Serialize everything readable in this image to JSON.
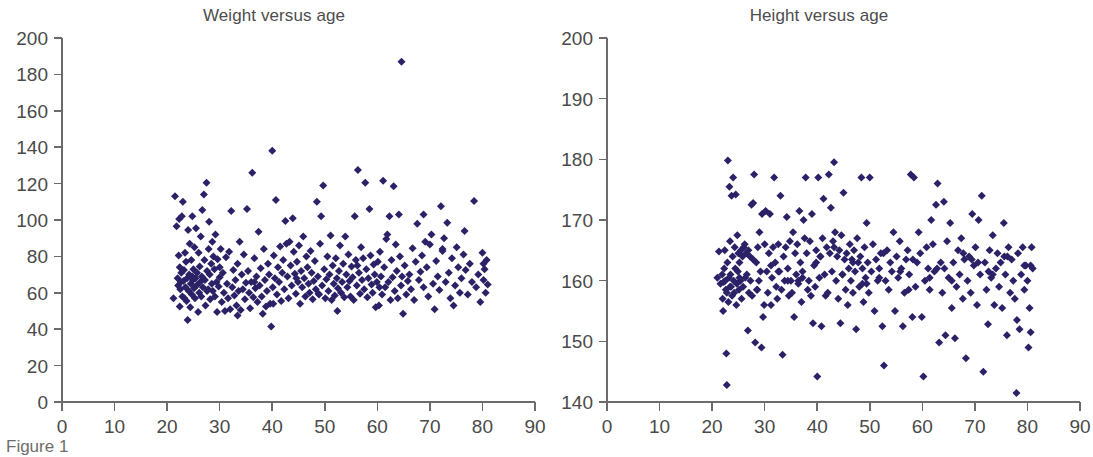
{
  "figure": {
    "caption": "Figure 1",
    "background_color": "#ffffff",
    "marker_color": "#2a2166",
    "axis_color": "#6b6b6b",
    "text_color": "#4a4a4a"
  },
  "chart_data": [
    {
      "type": "scatter",
      "id": "weight-versus-age",
      "title": "Weight versus age",
      "xlabel": "",
      "ylabel": "",
      "xlim": [
        0,
        90
      ],
      "ylim": [
        0,
        200
      ],
      "xticks": [
        0,
        10,
        20,
        30,
        40,
        50,
        60,
        70,
        80,
        90
      ],
      "yticks": [
        0,
        20,
        40,
        60,
        80,
        100,
        120,
        140,
        160,
        180,
        200
      ],
      "grid": false,
      "legend": "none",
      "marker": "diamond",
      "marker_color": "#2a2166",
      "n_points": 318,
      "annotations": [
        "single high outlier near age 29, weight 187"
      ],
      "x": [
        21.2,
        21.5,
        21.8,
        22.0,
        22.1,
        22.2,
        22.3,
        22.4,
        22.5,
        22.6,
        22.7,
        22.8,
        22.9,
        23.0,
        23.1,
        23.2,
        23.3,
        23.4,
        23.5,
        23.6,
        23.7,
        23.8,
        23.9,
        24.0,
        24.1,
        24.2,
        24.3,
        24.4,
        24.5,
        24.6,
        24.7,
        24.8,
        24.9,
        25.0,
        25.1,
        25.2,
        25.3,
        25.4,
        25.5,
        25.6,
        25.7,
        25.9,
        26.0,
        26.1,
        26.2,
        26.3,
        26.4,
        26.5,
        26.6,
        26.7,
        26.8,
        27.0,
        27.1,
        27.2,
        27.3,
        27.5,
        27.6,
        27.8,
        27.9,
        28.0,
        28.1,
        28.2,
        28.4,
        28.5,
        28.6,
        28.7,
        28.8,
        29.0,
        29.1,
        29.2,
        29.4,
        29.5,
        29.6,
        29.8,
        30.0,
        30.2,
        30.4,
        30.6,
        30.8,
        31.0,
        31.2,
        31.4,
        31.6,
        31.8,
        32.0,
        32.2,
        32.4,
        32.6,
        32.8,
        33.0,
        33.2,
        33.4,
        33.6,
        33.8,
        34.0,
        34.2,
        34.4,
        34.6,
        34.8,
        35.0,
        35.2,
        35.4,
        35.6,
        35.8,
        36.0,
        36.2,
        36.4,
        36.6,
        36.8,
        37.0,
        37.2,
        37.4,
        37.6,
        37.8,
        38.0,
        38.2,
        38.4,
        38.6,
        38.8,
        39.0,
        39.2,
        39.4,
        39.6,
        39.8,
        40.0,
        40.1,
        40.3,
        40.5,
        40.7,
        40.9,
        41.1,
        41.3,
        41.5,
        41.7,
        41.9,
        42.1,
        42.3,
        42.5,
        42.7,
        42.9,
        43.1,
        43.3,
        43.5,
        43.7,
        43.9,
        44.1,
        44.3,
        44.5,
        44.7,
        44.9,
        45.1,
        45.3,
        45.5,
        45.7,
        45.9,
        46.1,
        46.3,
        46.5,
        46.7,
        46.9,
        47.1,
        47.3,
        47.5,
        47.7,
        47.9,
        48.1,
        48.3,
        48.5,
        48.7,
        48.9,
        49.1,
        49.3,
        49.5,
        49.7,
        49.9,
        50.1,
        50.3,
        50.5,
        50.7,
        50.9,
        51.1,
        51.3,
        51.5,
        51.7,
        51.9,
        52.1,
        52.3,
        52.5,
        52.7,
        52.9,
        53.1,
        53.3,
        53.5,
        53.7,
        53.9,
        54.1,
        54.3,
        54.5,
        54.7,
        54.9,
        55.1,
        55.3,
        55.5,
        55.7,
        55.9,
        56.1,
        56.3,
        56.5,
        56.7,
        56.9,
        57.1,
        57.3,
        57.5,
        57.7,
        57.9,
        58.1,
        58.3,
        58.5,
        58.7,
        58.9,
        59.1,
        59.3,
        59.5,
        59.7,
        59.9,
        60.1,
        60.3,
        60.5,
        60.7,
        60.9,
        61.1,
        61.3,
        61.5,
        61.7,
        61.9,
        62.1,
        62.3,
        62.5,
        62.7,
        62.9,
        63.1,
        63.3,
        63.5,
        63.7,
        63.9,
        64.1,
        64.3,
        64.5,
        64.7,
        64.9,
        65.2,
        65.5,
        65.8,
        66.1,
        66.4,
        66.7,
        67.0,
        67.3,
        67.6,
        67.9,
        68.2,
        68.5,
        68.8,
        69.1,
        69.4,
        69.7,
        70.0,
        70.3,
        70.6,
        70.9,
        71.2,
        71.5,
        71.8,
        72.1,
        72.4,
        72.7,
        73.0,
        73.3,
        73.6,
        73.9,
        74.2,
        74.5,
        74.8,
        75.1,
        75.4,
        75.7,
        76.0,
        76.4,
        76.8,
        77.2,
        77.6,
        78.0,
        78.4,
        78.8,
        79.2,
        79.6,
        80.0,
        80.2,
        80.4,
        80.6,
        80.8,
        81.0,
        22.4,
        24.8,
        27.6,
        30.0,
        33.4,
        36.6,
        40.2,
        44.6,
        48.8,
        52.4,
        56.2,
        60.4,
        64.6,
        68.8,
        72.4,
        76.6,
        80.2
      ],
      "y": [
        57.0,
        113.0,
        96.5,
        68.0,
        64.0,
        80.5,
        100.5,
        74.0,
        62.0,
        66.0,
        71.0,
        102.0,
        58.0,
        110.0,
        66.5,
        72.5,
        57.0,
        82.0,
        63.0,
        77.0,
        55.5,
        68.0,
        45.0,
        94.5,
        61.0,
        70.0,
        87.0,
        52.0,
        65.0,
        78.0,
        59.0,
        102.0,
        67.0,
        73.0,
        62.5,
        85.0,
        57.0,
        68.0,
        95.5,
        64.0,
        71.0,
        49.5,
        82.0,
        60.0,
        74.5,
        66.0,
        91.0,
        58.0,
        69.0,
        105.5,
        63.0,
        114.0,
        78.0,
        67.0,
        53.0,
        120.5,
        72.0,
        62.0,
        84.0,
        99.0,
        70.0,
        56.5,
        76.0,
        65.0,
        88.0,
        61.0,
        80.0,
        73.0,
        58.0,
        92.0,
        66.0,
        49.5,
        78.5,
        63.5,
        68.5,
        84.0,
        55.0,
        71.0,
        60.0,
        50.0,
        79.5,
        65.0,
        57.0,
        82.5,
        51.0,
        105.0,
        63.0,
        72.5,
        58.5,
        67.0,
        53.0,
        76.0,
        61.0,
        88.0,
        50.5,
        70.0,
        62.0,
        81.0,
        56.5,
        65.5,
        106.0,
        72.0,
        60.0,
        51.5,
        66.0,
        126.0,
        57.5,
        79.0,
        62.5,
        69.0,
        55.0,
        93.5,
        64.0,
        73.5,
        58.0,
        48.5,
        84.0,
        67.0,
        52.5,
        61.0,
        76.0,
        70.0,
        54.0,
        41.5,
        138.0,
        63.0,
        80.5,
        68.0,
        111.0,
        59.0,
        74.0,
        66.0,
        85.5,
        55.5,
        71.0,
        78.0,
        62.0,
        99.5,
        87.0,
        69.0,
        57.0,
        88.0,
        75.0,
        64.0,
        101.0,
        82.5,
        70.5,
        59.5,
        77.0,
        66.0,
        86.0,
        54.0,
        72.0,
        63.0,
        91.0,
        68.0,
        58.0,
        80.0,
        74.0,
        65.0,
        60.0,
        83.0,
        71.0,
        56.5,
        66.5,
        77.5,
        62.0,
        110.0,
        69.0,
        59.0,
        87.0,
        102.0,
        64.0,
        119.0,
        73.0,
        57.0,
        67.5,
        80.0,
        61.0,
        70.0,
        91.5,
        56.0,
        75.0,
        65.0,
        58.5,
        79.0,
        68.0,
        62.5,
        72.0,
        86.0,
        60.0,
        66.0,
        76.0,
        57.5,
        91.0,
        70.0,
        63.0,
        81.0,
        66.5,
        58.0,
        74.5,
        68.5,
        56.0,
        102.0,
        78.0,
        64.0,
        127.5,
        71.0,
        59.5,
        85.0,
        67.0,
        79.0,
        62.0,
        120.5,
        73.0,
        57.5,
        68.0,
        106.0,
        80.5,
        64.5,
        60.0,
        75.5,
        70.0,
        52.0,
        66.0,
        77.0,
        53.0,
        82.5,
        69.0,
        59.0,
        121.5,
        74.0,
        63.0,
        89.5,
        92.0,
        66.0,
        102.0,
        56.0,
        78.0,
        68.5,
        118.5,
        61.0,
        86.5,
        72.0,
        57.0,
        103.0,
        80.0,
        64.0,
        69.0,
        48.5,
        75.0,
        59.0,
        66.5,
        70.0,
        62.0,
        84.5,
        56.0,
        77.0,
        98.0,
        67.0,
        71.5,
        80.5,
        63.0,
        88.0,
        74.0,
        58.0,
        86.5,
        92.0,
        65.0,
        51.0,
        77.5,
        69.0,
        61.5,
        107.5,
        83.0,
        90.0,
        66.0,
        98.5,
        71.0,
        57.0,
        79.0,
        53.0,
        64.0,
        85.0,
        74.0,
        60.0,
        68.0,
        81.0,
        72.5,
        59.0,
        76.0,
        66.0,
        110.5,
        63.0,
        70.0,
        55.0,
        82.0,
        67.0,
        73.0,
        60.0,
        78.0,
        64.5,
        52.5,
        69.0,
        61.0,
        74.0,
        47.5,
        66.0,
        54.0,
        68.0,
        59.5,
        50.0,
        75.0,
        63.0,
        187.0,
        103.0,
        84.0,
        94.0,
        76.0,
        66.0,
        85.0,
        82.0,
        96.5,
        61.0,
        73.0,
        89.0,
        63.0,
        95.0,
        80.0,
        72.0,
        67.0
      ]
    },
    {
      "type": "scatter",
      "id": "height-versus-age",
      "title": "Height versus age",
      "xlabel": "",
      "ylabel": "",
      "xlim": [
        0,
        90
      ],
      "ylim": [
        140,
        200
      ],
      "xticks": [
        0,
        10,
        20,
        30,
        40,
        50,
        60,
        70,
        80,
        90
      ],
      "yticks": [
        140,
        150,
        160,
        170,
        180,
        190,
        200
      ],
      "grid": false,
      "legend": "none",
      "marker": "diamond",
      "marker_color": "#2a2166",
      "n_points": 318,
      "annotations": [
        "low outlier near age 78, height 141"
      ],
      "x": [
        21.0,
        21.3,
        21.6,
        21.9,
        22.0,
        22.1,
        22.2,
        22.3,
        22.4,
        22.5,
        22.6,
        22.7,
        22.8,
        22.9,
        23.0,
        23.1,
        23.2,
        23.3,
        23.4,
        23.5,
        23.6,
        23.7,
        23.8,
        23.9,
        24.0,
        24.1,
        24.2,
        24.3,
        24.4,
        24.5,
        24.6,
        24.7,
        24.8,
        24.9,
        25.0,
        25.1,
        25.2,
        25.4,
        25.5,
        25.6,
        25.8,
        25.9,
        26.0,
        26.2,
        26.3,
        26.5,
        26.6,
        26.8,
        26.9,
        27.0,
        27.2,
        27.3,
        27.5,
        27.6,
        27.8,
        28.0,
        28.2,
        28.4,
        28.5,
        28.7,
        28.9,
        29.0,
        29.2,
        29.4,
        29.5,
        29.7,
        29.9,
        30.0,
        30.2,
        30.4,
        30.6,
        30.8,
        31.0,
        31.2,
        31.4,
        31.6,
        31.8,
        32.0,
        32.2,
        32.4,
        32.6,
        32.8,
        33.0,
        33.2,
        33.4,
        33.6,
        33.8,
        34.0,
        34.2,
        34.4,
        34.6,
        34.8,
        35.0,
        35.2,
        35.4,
        35.6,
        35.8,
        36.0,
        36.2,
        36.4,
        36.6,
        36.8,
        37.0,
        37.2,
        37.4,
        37.6,
        37.8,
        38.0,
        38.2,
        38.4,
        38.6,
        38.8,
        39.0,
        39.2,
        39.4,
        39.6,
        39.8,
        40.0,
        40.2,
        40.4,
        40.6,
        40.8,
        41.0,
        41.2,
        41.4,
        41.6,
        41.8,
        42.0,
        42.2,
        42.4,
        42.6,
        42.8,
        43.0,
        43.2,
        43.4,
        43.6,
        43.8,
        44.0,
        44.2,
        44.4,
        44.6,
        44.8,
        45.0,
        45.2,
        45.4,
        45.6,
        45.8,
        46.0,
        46.2,
        46.4,
        46.6,
        46.8,
        47.0,
        47.2,
        47.4,
        47.6,
        47.8,
        48.0,
        48.2,
        48.4,
        48.6,
        48.8,
        49.0,
        49.2,
        49.4,
        49.6,
        49.8,
        50.0,
        50.3,
        50.6,
        50.9,
        51.2,
        51.5,
        51.8,
        52.1,
        52.4,
        52.7,
        53.0,
        53.3,
        53.6,
        53.9,
        54.2,
        54.5,
        54.8,
        55.1,
        55.4,
        55.7,
        56.0,
        56.3,
        56.6,
        56.9,
        57.2,
        57.5,
        57.8,
        58.1,
        58.4,
        58.7,
        59.0,
        59.3,
        59.6,
        59.9,
        60.2,
        60.5,
        60.8,
        61.1,
        61.4,
        61.7,
        62.0,
        62.3,
        62.6,
        62.9,
        63.2,
        63.5,
        63.8,
        64.1,
        64.4,
        64.7,
        65.0,
        65.3,
        65.6,
        65.9,
        66.2,
        66.5,
        66.8,
        67.1,
        67.4,
        67.7,
        68.0,
        68.3,
        68.6,
        68.9,
        69.2,
        69.5,
        69.8,
        70.1,
        70.4,
        70.7,
        71.0,
        71.3,
        71.6,
        71.9,
        72.2,
        72.5,
        72.8,
        73.1,
        73.4,
        73.7,
        74.0,
        74.3,
        74.6,
        74.9,
        75.2,
        75.5,
        75.8,
        76.1,
        76.4,
        76.7,
        77.0,
        77.3,
        77.6,
        77.9,
        78.2,
        78.5,
        78.8,
        79.1,
        79.4,
        79.7,
        80.0,
        80.2,
        80.4,
        80.6,
        80.8,
        81.0,
        22.8,
        25.2,
        28.6,
        31.2,
        34.4,
        37.2,
        40.6,
        43.2,
        46.8,
        49.4,
        52.6,
        55.8,
        58.2,
        61.4,
        64.2,
        67.8,
        70.6,
        73.4,
        76.2,
        79.4,
        23.4,
        27.8,
        32.6,
        36.4,
        39.8,
        44.8,
        48.6,
        51.8,
        57.4,
        62.8,
        65.6,
        69.4,
        72.6,
        75.6,
        78.0,
        80.6
      ],
      "y": [
        160.5,
        164.8,
        159.5,
        161.0,
        157.0,
        155.0,
        159.8,
        162.0,
        165.0,
        160.0,
        158.5,
        148.0,
        142.8,
        163.0,
        179.8,
        156.5,
        160.5,
        175.5,
        166.5,
        161.0,
        159.0,
        174.0,
        157.5,
        164.0,
        177.0,
        160.0,
        158.0,
        165.5,
        162.0,
        174.2,
        156.0,
        159.5,
        167.5,
        161.5,
        164.5,
        158.5,
        163.0,
        160.0,
        165.0,
        157.0,
        164.0,
        159.0,
        165.5,
        166.0,
        160.5,
        164.5,
        161.0,
        151.8,
        165.0,
        158.0,
        164.0,
        160.0,
        172.5,
        157.5,
        172.8,
        177.5,
        149.8,
        163.0,
        158.5,
        165.5,
        160.0,
        168.0,
        161.5,
        149.0,
        171.0,
        154.0,
        156.0,
        166.0,
        171.5,
        161.5,
        158.0,
        164.5,
        171.0,
        156.0,
        160.5,
        165.5,
        177.0,
        163.0,
        159.0,
        157.0,
        166.0,
        161.5,
        174.0,
        158.5,
        147.8,
        164.0,
        160.0,
        165.5,
        170.5,
        162.0,
        157.5,
        166.5,
        160.0,
        158.0,
        168.0,
        154.0,
        164.5,
        161.0,
        166.0,
        159.5,
        171.5,
        163.0,
        156.5,
        160.5,
        170.0,
        167.0,
        177.0,
        164.5,
        158.5,
        160.0,
        166.5,
        157.5,
        171.0,
        153.0,
        162.5,
        159.0,
        165.0,
        144.2,
        177.0,
        160.5,
        164.0,
        152.5,
        167.0,
        173.5,
        161.0,
        157.5,
        165.5,
        158.0,
        177.5,
        164.5,
        172.0,
        161.5,
        166.5,
        179.5,
        168.0,
        160.0,
        164.0,
        157.0,
        165.0,
        153.0,
        167.5,
        161.0,
        174.5,
        163.5,
        158.5,
        164.5,
        156.0,
        162.0,
        166.0,
        160.0,
        163.5,
        158.0,
        165.0,
        161.5,
        152.0,
        167.0,
        163.0,
        159.0,
        164.0,
        177.0,
        162.0,
        156.5,
        165.5,
        160.5,
        169.5,
        163.0,
        158.0,
        177.0,
        161.5,
        166.0,
        155.0,
        163.5,
        160.0,
        162.0,
        164.5,
        152.5,
        146.0,
        160.0,
        165.0,
        158.5,
        163.0,
        161.5,
        168.0,
        155.0,
        164.0,
        160.5,
        166.5,
        162.0,
        152.5,
        158.0,
        163.5,
        165.0,
        161.0,
        177.5,
        154.0,
        177.0,
        159.0,
        163.0,
        168.0,
        164.5,
        154.0,
        144.2,
        160.0,
        165.5,
        162.0,
        158.5,
        170.0,
        166.0,
        161.5,
        172.5,
        176.0,
        149.8,
        163.0,
        158.0,
        173.0,
        151.0,
        166.5,
        160.5,
        169.5,
        155.5,
        163.0,
        150.5,
        159.0,
        165.0,
        161.0,
        167.0,
        157.0,
        163.5,
        147.2,
        160.0,
        164.0,
        158.0,
        171.0,
        162.5,
        165.5,
        156.0,
        170.0,
        161.0,
        174.0,
        145.0,
        163.0,
        158.5,
        152.8,
        165.0,
        160.5,
        167.5,
        156.0,
        162.0,
        164.5,
        159.0,
        163.0,
        155.5,
        169.5,
        161.0,
        151.0,
        165.5,
        158.0,
        163.5,
        160.0,
        157.0,
        141.5,
        164.5,
        152.0,
        161.0,
        165.5,
        158.5,
        162.5,
        160.0,
        149.0,
        155.5,
        151.5,
        165.5,
        162.0,
        158.0,
        160.5,
        158.5,
        162.5,
        160.0,
        161.5,
        164.0,
        165.5,
        163.0,
        159.5,
        164.5,
        161.5,
        163.5,
        160.5,
        162.0,
        164.5,
        163.0,
        161.0,
        164.0,
        162.5,
        159.0,
        163.5,
        161.5,
        160.0,
        163.0,
        161.0,
        159.5,
        160.5,
        158.5,
        162.0,
        160.0,
        163.5,
        161.5,
        164.0,
        153.5,
        162.5,
        159.5,
        160.5,
        153.5,
        156.0,
        162.5,
        161.0,
        152.0
      ]
    }
  ]
}
